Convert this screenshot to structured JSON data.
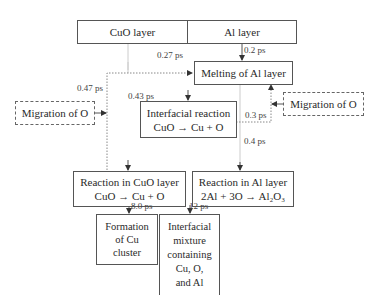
{
  "diagram": {
    "layers": {
      "cuo": "CuO layer",
      "al": "Al layer"
    },
    "nodes": {
      "melting": "Melting of Al layer",
      "migration_left": "Migration of O",
      "migration_right": "Migration of O",
      "interfacial_reaction": {
        "line1": "Interfacial reaction",
        "line2": "CuO → Cu + O"
      },
      "reaction_cuo": {
        "line1": "Reaction in CuO layer",
        "line2": "CuO → Cu + O"
      },
      "reaction_al": {
        "line1": "Reaction in Al layer",
        "line2": "2Al + 3O → Al₂O₃"
      },
      "formation_cu": {
        "line1": "Formation",
        "line2": "of Cu",
        "line3": "cluster"
      },
      "interfacial_mixture": {
        "line1": "Interfacial",
        "line2": "mixture",
        "line3": "containing",
        "line4": "Cu, O,",
        "line5": "and Al"
      }
    },
    "times": {
      "t027": "0.27 ps",
      "t02": "0.2 ps",
      "t047": "0.47 ps",
      "t043": "0.43 ps",
      "t03": "0.3 ps",
      "t04": "0.4 ps",
      "t80": "8.0 ps",
      "t12": "12 ps"
    },
    "colors": {
      "line": "#555555",
      "dotted": "#888888"
    }
  }
}
